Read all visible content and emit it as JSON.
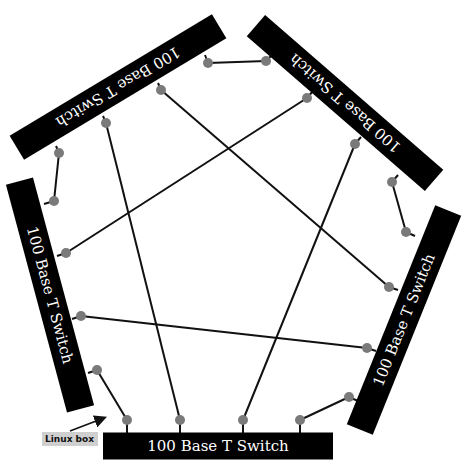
{
  "colors": {
    "background": "#ffffff",
    "switch_fill": "#000000",
    "switch_text": "#ffffff",
    "port": "#7a7a7a",
    "link": "#111111",
    "note_bg": "#cfcfcf"
  },
  "switches": [
    {
      "id": "top-left",
      "label": "100 Base T Switch",
      "cx": 118,
      "cy": 87,
      "w": 236,
      "h": 28,
      "rotate": 149
    },
    {
      "id": "top-right",
      "label": "100 Base T Switch",
      "cx": 345,
      "cy": 103,
      "w": 236,
      "h": 28,
      "rotate": 221
    },
    {
      "id": "right",
      "label": "100 Base T Switch",
      "cx": 404,
      "cy": 320,
      "w": 236,
      "h": 28,
      "rotate": -68
    },
    {
      "id": "bottom",
      "label": "100 Base T Switch",
      "cx": 218,
      "cy": 446,
      "w": 230,
      "h": 27,
      "rotate": 0
    },
    {
      "id": "left",
      "label": "100 Base T Switch",
      "cx": 50,
      "cy": 295,
      "w": 236,
      "h": 28,
      "rotate": 75
    }
  ],
  "ports": [
    {
      "switch": "top-left",
      "x": 208,
      "y": 63,
      "sx": 205,
      "sy": 55
    },
    {
      "switch": "top-left",
      "x": 161,
      "y": 90,
      "sx": 158,
      "sy": 83
    },
    {
      "switch": "top-left",
      "x": 106,
      "y": 123,
      "sx": 103,
      "sy": 116
    },
    {
      "switch": "top-left",
      "x": 59,
      "y": 153,
      "sx": 56,
      "sy": 146
    },
    {
      "switch": "top-right",
      "x": 266,
      "y": 61,
      "sx": 273,
      "sy": 54
    },
    {
      "switch": "top-right",
      "x": 307,
      "y": 98,
      "sx": 313,
      "sy": 91
    },
    {
      "switch": "top-right",
      "x": 355,
      "y": 144,
      "sx": 361,
      "sy": 137
    },
    {
      "switch": "top-right",
      "x": 392,
      "y": 182,
      "sx": 398,
      "sy": 175
    },
    {
      "switch": "right",
      "x": 406,
      "y": 232,
      "sx": 415,
      "sy": 236
    },
    {
      "switch": "right",
      "x": 389,
      "y": 287,
      "sx": 398,
      "sy": 290
    },
    {
      "switch": "right",
      "x": 367,
      "y": 348,
      "sx": 376,
      "sy": 351
    },
    {
      "switch": "right",
      "x": 349,
      "y": 397,
      "sx": 358,
      "sy": 401
    },
    {
      "switch": "bottom",
      "x": 127,
      "y": 420,
      "sx": 127,
      "sy": 433
    },
    {
      "switch": "bottom",
      "x": 180,
      "y": 420,
      "sx": 180,
      "sy": 433
    },
    {
      "switch": "bottom",
      "x": 243,
      "y": 420,
      "sx": 243,
      "sy": 433
    },
    {
      "switch": "bottom",
      "x": 300,
      "y": 420,
      "sx": 300,
      "sy": 433
    },
    {
      "switch": "left",
      "x": 54,
      "y": 201,
      "sx": 44,
      "sy": 204
    },
    {
      "switch": "left",
      "x": 66,
      "y": 253,
      "sx": 57,
      "sy": 256
    },
    {
      "switch": "left",
      "x": 81,
      "y": 316,
      "sx": 72,
      "sy": 319
    },
    {
      "switch": "left",
      "x": 97,
      "y": 370,
      "sx": 88,
      "sy": 373
    }
  ],
  "links": [
    {
      "x1": 208,
      "y1": 63,
      "x2": 266,
      "y2": 61
    },
    {
      "x1": 161,
      "y1": 90,
      "x2": 389,
      "y2": 287
    },
    {
      "x1": 106,
      "y1": 123,
      "x2": 180,
      "y2": 420
    },
    {
      "x1": 59,
      "y1": 153,
      "x2": 54,
      "y2": 201
    },
    {
      "x1": 307,
      "y1": 98,
      "x2": 66,
      "y2": 253
    },
    {
      "x1": 355,
      "y1": 144,
      "x2": 243,
      "y2": 420
    },
    {
      "x1": 392,
      "y1": 182,
      "x2": 406,
      "y2": 232
    },
    {
      "x1": 81,
      "y1": 316,
      "x2": 367,
      "y2": 348
    },
    {
      "x1": 97,
      "y1": 370,
      "x2": 127,
      "y2": 420
    },
    {
      "x1": 349,
      "y1": 397,
      "x2": 300,
      "y2": 420
    }
  ],
  "annotation": {
    "label": "Linux box",
    "box": {
      "x": 42,
      "y": 432,
      "w": 56,
      "h": 14
    },
    "arrow": {
      "x1": 70,
      "y1": 431,
      "x2": 104,
      "y2": 418
    }
  }
}
